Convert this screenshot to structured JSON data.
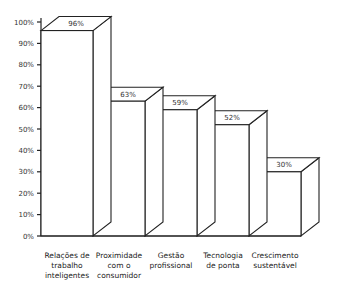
{
  "chart_data": {
    "type": "bar",
    "style": "3d-columns",
    "title": "",
    "xlabel": "",
    "ylabel": "",
    "ylim": [
      0,
      100
    ],
    "yticks": [
      "0%",
      "10%",
      "20%",
      "30%",
      "40%",
      "50%",
      "60%",
      "70%",
      "80%",
      "90%",
      "100%"
    ],
    "categories": [
      [
        "Relações de",
        "trabalho",
        "inteligentes"
      ],
      [
        "Proximidade",
        "com o",
        "consumidor"
      ],
      [
        "Gestão",
        "profissional"
      ],
      [
        "Tecnologia",
        "de ponta"
      ],
      [
        "Crescimento",
        "sustentável"
      ]
    ],
    "values": [
      96,
      63,
      59,
      52,
      30
    ],
    "value_labels": [
      "96%",
      "63%",
      "59%",
      "52%",
      "30%"
    ],
    "grid": false,
    "legend": null
  }
}
